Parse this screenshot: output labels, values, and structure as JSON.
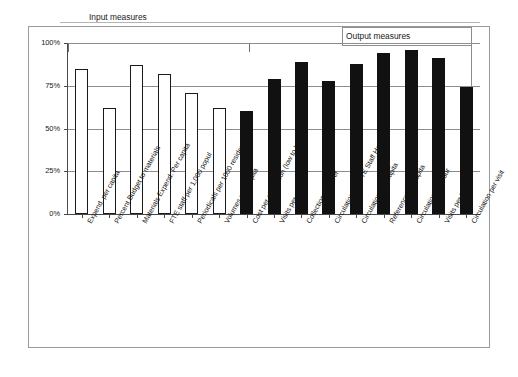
{
  "chart_data": {
    "type": "bar",
    "title": "",
    "xlabel": "",
    "ylabel": "",
    "ylim": [
      0,
      100
    ],
    "yticks": [
      "0%",
      "25%",
      "50%",
      "75%",
      "100%"
    ],
    "ytick_values": [
      0,
      25,
      50,
      75,
      100
    ],
    "grid": true,
    "legend": "none",
    "categories": [
      "Expend. per capita",
      "Percent Budget to materials",
      "Materials Expend. Per capita",
      "FTE staff per 1,000 popul",
      "Periodicals per 1000 residents",
      "Volumes per Capita",
      "Cost per circulation (low to high)",
      "Visits per capita",
      "Collection turnover",
      "Circulation per FTE Staff Hour",
      "Circulation per Capita",
      "Reference per capita",
      "Circulation per hour",
      "Visits per hour",
      "Circulation per visit"
    ],
    "values": [
      85,
      62,
      87,
      82,
      71,
      62,
      60,
      79,
      89,
      78,
      88,
      94,
      96,
      91,
      74
    ],
    "groups": [
      "input",
      "input",
      "input",
      "input",
      "input",
      "input",
      "output",
      "output",
      "output",
      "output",
      "output",
      "output",
      "output",
      "output",
      "output"
    ],
    "group_styles": {
      "input": {
        "fill": "#ffffff",
        "stroke": "#1a1a1a"
      },
      "output": {
        "fill": "#111111",
        "stroke": "#111111"
      }
    },
    "annotations": [
      {
        "name": "input-measures",
        "text": "Input measures"
      },
      {
        "name": "output-measures",
        "text": "Output measures"
      }
    ]
  },
  "annotations": {
    "input_label": "Input measures",
    "output_label": "Output measures"
  }
}
